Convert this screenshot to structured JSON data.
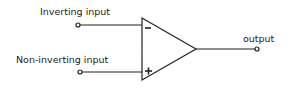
{
  "diagram": {
    "labels": {
      "inverting": "Inverting input",
      "non_inverting": "Non-inverting input",
      "output": "output"
    },
    "signs": {
      "inverting": "−",
      "non_inverting": "+"
    },
    "colors": {
      "stroke": "#222222",
      "background": "#ffffff"
    }
  }
}
